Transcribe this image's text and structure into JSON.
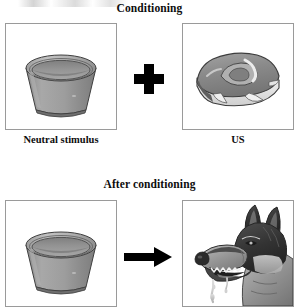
{
  "figure": {
    "background_color": "#ffffff",
    "frame_border_color": "#9a9a9a",
    "ink_color": "#000000"
  },
  "sections": {
    "top": {
      "title": "Conditioning",
      "left_panel": {
        "image_name": "dog-bowl-illustration",
        "caption": "Neutral stimulus"
      },
      "operator": {
        "symbol": "+",
        "icon_name": "plus-icon"
      },
      "right_panel": {
        "image_name": "steak-illustration",
        "caption": "US"
      }
    },
    "bottom": {
      "title": "After conditioning",
      "left_panel": {
        "image_name": "dog-bowl-illustration",
        "caption": ""
      },
      "operator": {
        "symbol": "→",
        "icon_name": "right-arrow-icon"
      },
      "right_panel": {
        "image_name": "salivating-dog-illustration",
        "caption": ""
      }
    }
  },
  "colors": {
    "bowl_body": "#9a9a9a",
    "bowl_rim": "#b4b4b4",
    "bowl_interior": "#8c8c8c",
    "steak_meat": "#8f8f8f",
    "steak_fat": "#e8e8e8",
    "dog_dark": "#3a3a3a",
    "dog_mid": "#8d8d8d",
    "dog_light": "#d8d8d8",
    "saliva": "#cfcfcf"
  }
}
